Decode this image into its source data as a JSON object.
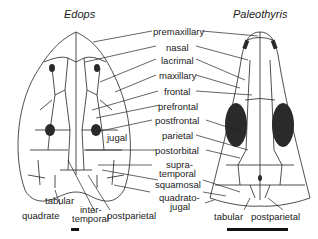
{
  "figure": {
    "left_skull": {
      "title": "Edops"
    },
    "right_skull": {
      "title": "Paleothyris"
    },
    "center_labels": [
      {
        "id": "premaxillary",
        "text": "premaxillary"
      },
      {
        "id": "nasal",
        "text": "nasal"
      },
      {
        "id": "lacrimal",
        "text": "lacrimal"
      },
      {
        "id": "maxillary",
        "text": "maxillary"
      },
      {
        "id": "frontal",
        "text": "frontal"
      },
      {
        "id": "prefrontal",
        "text": "prefrontal"
      },
      {
        "id": "postfrontal",
        "text": "postfrontal"
      },
      {
        "id": "parietal",
        "text": "parietal"
      },
      {
        "id": "postorbital",
        "text": "postorbital"
      },
      {
        "id": "supratemporal_1",
        "text": "supra-"
      },
      {
        "id": "supratemporal_2",
        "text": "temporal"
      },
      {
        "id": "squamosal",
        "text": "squamosal"
      },
      {
        "id": "quadratojugal_1",
        "text": "quadrato-"
      },
      {
        "id": "quadratojugal_2",
        "text": "jugal"
      }
    ],
    "left_labels": {
      "jugal": "jugal",
      "tabular": "tabular",
      "quadrate": "quadrate",
      "intertemporal_1": "inter-",
      "intertemporal_2": "temporal",
      "postparietal": "postparietal"
    },
    "right_labels": {
      "tabular": "tabular",
      "postparietal": "postparietal"
    },
    "colors": {
      "line": "#222222",
      "fill": "#ffffff",
      "fenestra": "#2a2a2a"
    }
  }
}
